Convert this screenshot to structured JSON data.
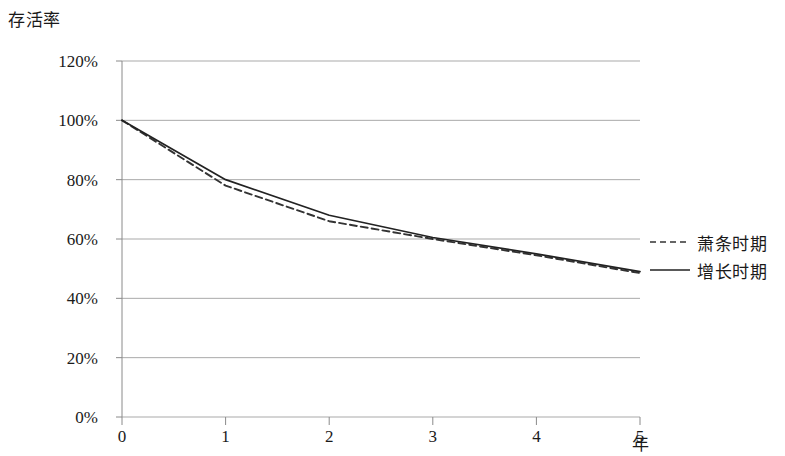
{
  "chart_data": {
    "type": "line",
    "title": "",
    "xlabel": "年",
    "ylabel": "存活率",
    "x": [
      0,
      1,
      2,
      3,
      4,
      5
    ],
    "xtick_labels": [
      "0",
      "1",
      "2",
      "3",
      "4",
      "5"
    ],
    "ytick_labels": [
      "0%",
      "20%",
      "40%",
      "60%",
      "80%",
      "100%",
      "120%"
    ],
    "ytick_values": [
      0,
      20,
      40,
      60,
      80,
      100,
      120
    ],
    "ylim": [
      0,
      120
    ],
    "xlim": [
      0,
      5
    ],
    "grid": "horizontal",
    "legend_position": "right",
    "series": [
      {
        "name": "萧条时期",
        "style": "dashed",
        "color": "#333333",
        "values": [
          100,
          78,
          66,
          60,
          54.5,
          48.5
        ]
      },
      {
        "name": "增长时期",
        "style": "solid",
        "color": "#222222",
        "values": [
          100,
          80,
          68,
          60.5,
          55,
          49
        ]
      }
    ]
  },
  "legend": {
    "items": [
      {
        "label": "萧条时期",
        "style": "dashed"
      },
      {
        "label": "增长时期",
        "style": "solid"
      }
    ]
  },
  "axes": {
    "y_axis_title": "存活率",
    "x_axis_title": "年"
  }
}
